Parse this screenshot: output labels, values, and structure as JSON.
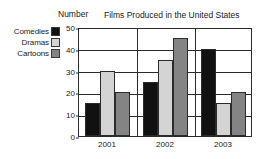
{
  "chart_data": {
    "type": "bar",
    "title": "Films Produced in the United States",
    "xlabel": "",
    "ylabel": "Number",
    "categories": [
      "2001",
      "2002",
      "2003"
    ],
    "series": [
      {
        "name": "Comedies",
        "color": "#111111",
        "values": [
          15,
          25,
          40
        ]
      },
      {
        "name": "Dramas",
        "color": "#d4d4d4",
        "values": [
          30,
          35,
          15
        ]
      },
      {
        "name": "Cartoons",
        "color": "#848484",
        "values": [
          20,
          45,
          20
        ]
      }
    ],
    "ylim": [
      0,
      50
    ],
    "yticks": [
      0,
      10,
      20,
      30,
      40,
      50
    ],
    "ytick_labels": [
      "0",
      "10",
      "20",
      "30",
      "40",
      "50"
    ],
    "grid": true,
    "legend_position": "left"
  },
  "legend": {
    "items": [
      {
        "label": "Comedies",
        "color": "#111111"
      },
      {
        "label": "Dramas",
        "color": "#d4d4d4"
      },
      {
        "label": "Cartoons",
        "color": "#848484"
      }
    ]
  },
  "axes": {
    "y_title": "Number",
    "y_labels": [
      "50",
      "40",
      "30",
      "20",
      "10",
      "0"
    ],
    "x_labels": [
      "2001",
      "2002",
      "2003"
    ]
  },
  "title": "Films Produced in the United States"
}
